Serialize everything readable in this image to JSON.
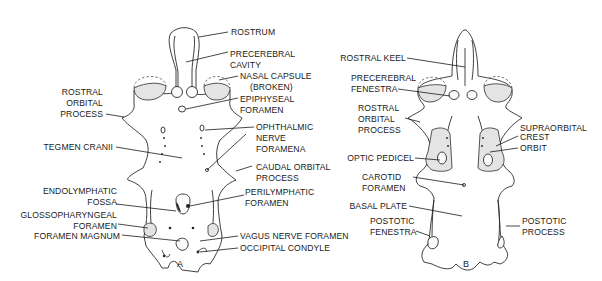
{
  "figure": {
    "panels": [
      {
        "id": "A",
        "label": "A",
        "labels": {
          "rostrum": "ROSTRUM",
          "precerebral_cavity_1": "PRECEREBRAL",
          "precerebral_cavity_2": "CAVITY",
          "nasal_capsule_1": "NASAL  CAPSULE",
          "nasal_capsule_2": "(BROKEN)",
          "rostral_orbital_1": "ROSTRAL",
          "rostral_orbital_2": "ORBITAL",
          "rostral_orbital_3": "PROCESS",
          "epiphyseal_1": "EPIPHYSEAL",
          "epiphyseal_2": "FORAMEN",
          "ophthalmic_1": "OPHTHALMIC",
          "ophthalmic_2": "NERVE",
          "ophthalmic_3": "FORAMENA",
          "tegmen_cranii": "TEGMEN CRANII",
          "caudal_orbital_1": "CAUDAL  ORBITAL",
          "caudal_orbital_2": "PROCESS",
          "endolymphatic_1": "ENDOLYMPHATIC",
          "endolymphatic_2": "FOSSA",
          "perilymphatic_1": "PERILYMPHATIC",
          "perilymphatic_2": "FORAMEN",
          "glossopharyngeal_1": "GLOSSOPHARYNGEAL",
          "glossopharyngeal_2": "FORAMEN",
          "foramen_magnum": "FORAMEN  MAGNUM",
          "vagus": "VAGUS  NERVE  FORAMEN",
          "occipital_condyle": "OCCIPITAL  CONDYLE"
        }
      },
      {
        "id": "B",
        "label": "B",
        "labels": {
          "rostral_keel": "ROSTRAL  KEEL",
          "precerebral_fenestra_1": "PRECEREBRAL",
          "precerebral_fenestra_2": "FENESTRA",
          "rostral_orbital_1": "ROSTRAL",
          "rostral_orbital_2": "ORBITAL",
          "rostral_orbital_3": "PROCESS",
          "supraorbital_1": "SUPRAORBITAL",
          "supraorbital_2": "CREST",
          "orbit": "ORBIT",
          "optic_pedicel": "OPTIC  PEDICEL",
          "carotid_1": "CAROTID",
          "carotid_2": "FORAMEN",
          "basal_plate": "BASAL  PLATE",
          "postotic_fenestra_1": "POSTOTIC",
          "postotic_fenestra_2": "FENESTRA",
          "postotic_process_1": "POSTOTIC",
          "postotic_process_2": "PROCESS"
        }
      }
    ]
  }
}
